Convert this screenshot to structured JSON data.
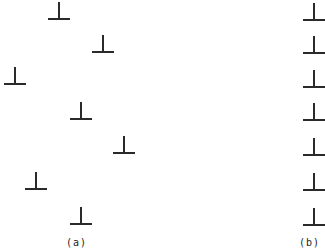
{
  "figure": {
    "panel_a": {
      "label": "(a)",
      "label_pos": [
        66,
        237
      ],
      "symbols": [
        {
          "x": 59,
          "y": 19
        },
        {
          "x": 103,
          "y": 52
        },
        {
          "x": 15,
          "y": 84
        },
        {
          "x": 81,
          "y": 119
        },
        {
          "x": 124,
          "y": 153
        },
        {
          "x": 36,
          "y": 189
        },
        {
          "x": 81,
          "y": 224
        }
      ]
    },
    "panel_b": {
      "label": "(b)",
      "label_pos": [
        299,
        237
      ],
      "symbols": [
        {
          "x": 314,
          "y": 20
        },
        {
          "x": 314,
          "y": 53
        },
        {
          "x": 314,
          "y": 87
        },
        {
          "x": 314,
          "y": 120
        },
        {
          "x": 314,
          "y": 155
        },
        {
          "x": 314,
          "y": 190
        },
        {
          "x": 314,
          "y": 225
        }
      ]
    },
    "symbol": {
      "name": "inverted-T (edge dislocation)",
      "stem_height": 17,
      "bar_half_width": 11,
      "color": "#2a2a2a"
    }
  }
}
